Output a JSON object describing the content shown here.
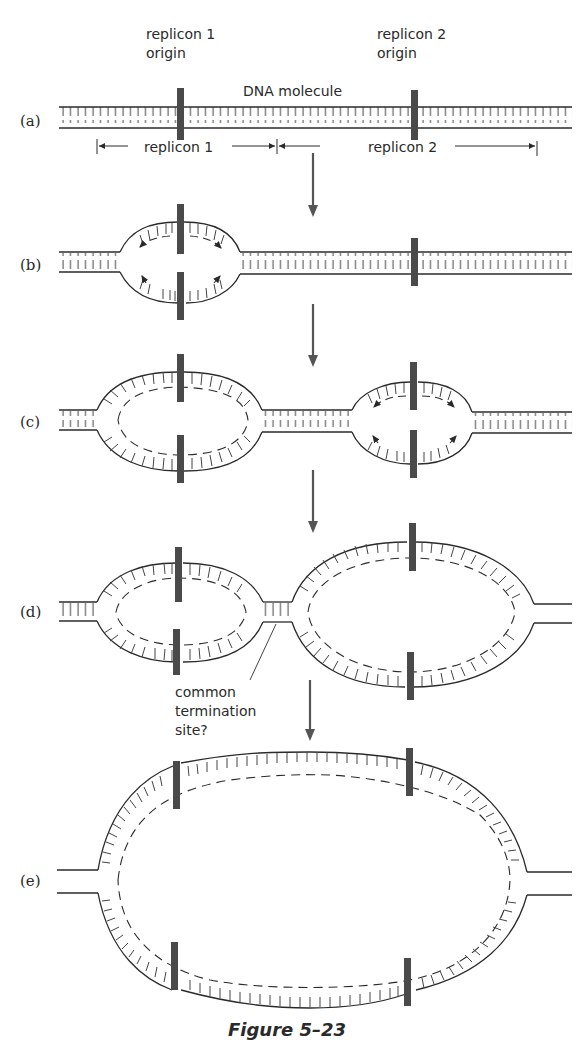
{
  "figure": {
    "caption": "Figure 5–23",
    "colors": {
      "ink": "#2a2a2a",
      "origin_bar": "#4a4a4a",
      "arrow": "#555555"
    },
    "labels": {
      "origin1_line1": "replicon 1",
      "origin1_line2": "origin",
      "origin2_line1": "replicon 2",
      "origin2_line2": "origin",
      "dna": "DNA molecule",
      "span1": "replicon 1",
      "span2": "replicon 2",
      "term_line1": "common",
      "term_line2": "termination",
      "term_line3": "site?"
    },
    "panels": [
      {
        "id": "a",
        "label": "(a)",
        "description": "Linear double-stranded DNA with two replicon origins"
      },
      {
        "id": "b",
        "label": "(b)",
        "description": "Replication bubble opens at replicon 1 origin, forks move bidirectionally"
      },
      {
        "id": "c",
        "label": "(c)",
        "description": "Replicon 1 bubble enlarges; replicon 2 bubble initiates"
      },
      {
        "id": "d",
        "label": "(d)",
        "description": "Both bubbles enlarge and approach a common termination site"
      },
      {
        "id": "e",
        "label": "(e)",
        "description": "Bubbles fuse into one large replicated region"
      }
    ]
  }
}
